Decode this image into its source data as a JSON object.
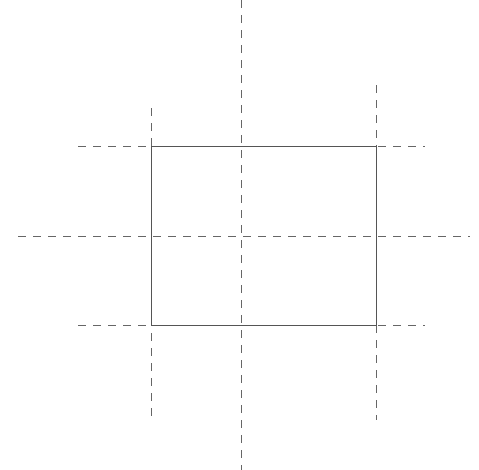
{
  "canvas": {
    "width": 479,
    "height": 470,
    "background": "#ffffff"
  },
  "colors": {
    "stroke": "#555555",
    "guide": "#666666"
  },
  "rectangle": {
    "x": 151,
    "y": 146,
    "width": 225,
    "height": 179
  },
  "guides": {
    "horizontal": [
      {
        "name": "top-edge-guide",
        "y": 146,
        "x1": 78,
        "x2": 425
      },
      {
        "name": "center-horizontal-guide",
        "y": 236,
        "x1": 18,
        "x2": 470
      },
      {
        "name": "bottom-edge-guide",
        "y": 325,
        "x1": 78,
        "x2": 425
      }
    ],
    "vertical": [
      {
        "name": "left-edge-guide",
        "x": 151,
        "y1": 108,
        "y2": 420
      },
      {
        "name": "center-vertical-guide",
        "x": 241,
        "y1": 0,
        "y2": 470
      },
      {
        "name": "right-edge-guide",
        "x": 376,
        "y1": 85,
        "y2": 420
      }
    ],
    "dash": "8,7"
  }
}
